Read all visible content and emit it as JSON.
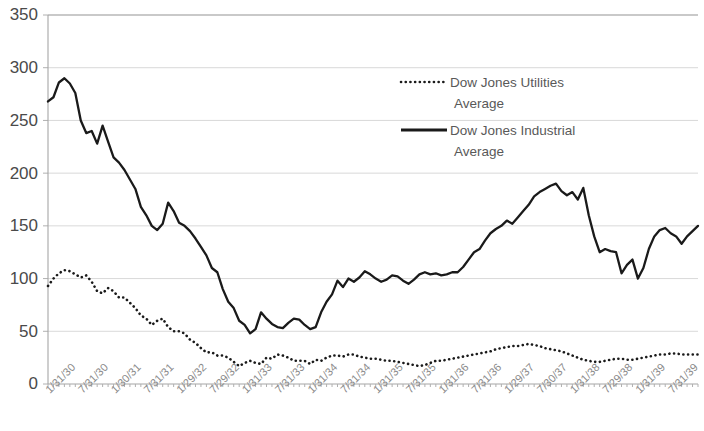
{
  "chart_data": {
    "type": "line",
    "title": "",
    "xlabel": "",
    "ylabel": "",
    "ylim": [
      0,
      350
    ],
    "ytick_step": 50,
    "ytick_labels": [
      "0",
      "50",
      "100",
      "150",
      "200",
      "250",
      "300",
      "350"
    ],
    "grid": true,
    "legend_position": "upper-center-right",
    "xtick_labels": [
      "1/31/30",
      "7/31/30",
      "1/30/31",
      "7/31/31",
      "1/29/32",
      "7/29/32",
      "1/31/33",
      "7/31/33",
      "1/31/34",
      "7/31/34",
      "1/31/35",
      "7/31/35",
      "1/31/36",
      "7/31/36",
      "1/29/37",
      "7/30/37",
      "1/31/38",
      "7/29/38",
      "1/31/39",
      "7/31/39"
    ],
    "xtick_interval_points": 6,
    "x_count": 120,
    "series": [
      {
        "name": "Dow Jones Utilities Average",
        "style": "dotted",
        "color": "#1a1a1a",
        "values": [
          93,
          100,
          105,
          108,
          107,
          104,
          101,
          103,
          97,
          88,
          86,
          91,
          88,
          82,
          82,
          77,
          72,
          65,
          62,
          56,
          60,
          62,
          54,
          50,
          50,
          48,
          42,
          39,
          34,
          30,
          30,
          27,
          27,
          25,
          21,
          17,
          20,
          22,
          20,
          19,
          25,
          24,
          28,
          27,
          25,
          22,
          22,
          22,
          19,
          23,
          22,
          25,
          27,
          27,
          26,
          28,
          28,
          26,
          25,
          24,
          24,
          23,
          22,
          22,
          21,
          20,
          19,
          18,
          17,
          18,
          20,
          22,
          22,
          23,
          24,
          25,
          26,
          27,
          28,
          29,
          30,
          31,
          33,
          34,
          35,
          36,
          36,
          37,
          38,
          37,
          36,
          34,
          33,
          32,
          31,
          29,
          27,
          25,
          23,
          22,
          21,
          21,
          22,
          23,
          24,
          24,
          23,
          23,
          24,
          25,
          26,
          27,
          28,
          28,
          29,
          29,
          28,
          28,
          28,
          28
        ]
      },
      {
        "name": "Dow Jones Industrial Average",
        "style": "solid",
        "color": "#1a1a1a",
        "values": [
          268,
          272,
          286,
          290,
          285,
          276,
          250,
          238,
          240,
          228,
          245,
          230,
          215,
          210,
          203,
          194,
          185,
          168,
          160,
          150,
          146,
          152,
          172,
          164,
          153,
          150,
          145,
          138,
          130,
          122,
          110,
          106,
          90,
          78,
          72,
          60,
          56,
          48,
          52,
          68,
          62,
          57,
          54,
          53,
          58,
          62,
          61,
          56,
          52,
          54,
          68,
          78,
          85,
          98,
          92,
          100,
          97,
          101,
          107,
          104,
          100,
          97,
          99,
          103,
          102,
          98,
          95,
          99,
          104,
          106,
          104,
          105,
          103,
          104,
          106,
          106,
          111,
          118,
          125,
          128,
          136,
          143,
          147,
          150,
          155,
          152,
          158,
          164,
          170,
          178,
          182,
          185,
          188,
          190,
          183,
          179,
          182,
          175,
          186,
          160,
          140,
          125,
          128,
          126,
          125,
          105,
          113,
          118,
          100,
          110,
          128,
          140,
          146,
          148,
          143,
          140,
          133,
          140,
          145,
          150
        ]
      }
    ]
  }
}
